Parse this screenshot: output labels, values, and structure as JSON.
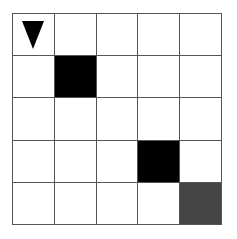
{
  "grid": {
    "rows": 5,
    "cols": 5,
    "cells": [
      [
        "agent",
        "empty",
        "empty",
        "empty",
        "empty"
      ],
      [
        "empty",
        "wall",
        "empty",
        "empty",
        "empty"
      ],
      [
        "empty",
        "empty",
        "empty",
        "empty",
        "empty"
      ],
      [
        "empty",
        "empty",
        "empty",
        "wall",
        "empty"
      ],
      [
        "empty",
        "empty",
        "empty",
        "empty",
        "goal"
      ]
    ],
    "agent": {
      "row": 0,
      "col": 0,
      "direction": "down",
      "icon": "triangle-down-icon"
    },
    "walls": [
      {
        "row": 1,
        "col": 1
      },
      {
        "row": 3,
        "col": 3
      }
    ],
    "goal": {
      "row": 4,
      "col": 4
    },
    "colors": {
      "wall": "#000000",
      "goal": "#444444",
      "empty": "#ffffff",
      "line": "#555555"
    }
  }
}
